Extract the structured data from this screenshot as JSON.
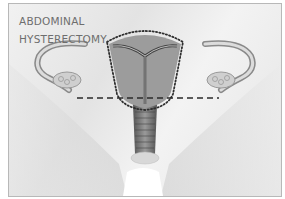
{
  "illustration": {
    "title_lines": [
      "ABDOMINAL",
      "HYSTERECTOMY"
    ],
    "subject": "Female reproductive anatomy showing uterus, fallopian tubes, ovaries, cervix and vagina",
    "annotations": {
      "dotted_outline": "region removed (uterus and cervix)",
      "dashed_line": "horizontal incision line"
    },
    "colors": {
      "background": "#e8e8e8",
      "uterus_fill": "#9a9a9a",
      "outline": "#333333",
      "title_text": "#6e6e6e"
    }
  }
}
